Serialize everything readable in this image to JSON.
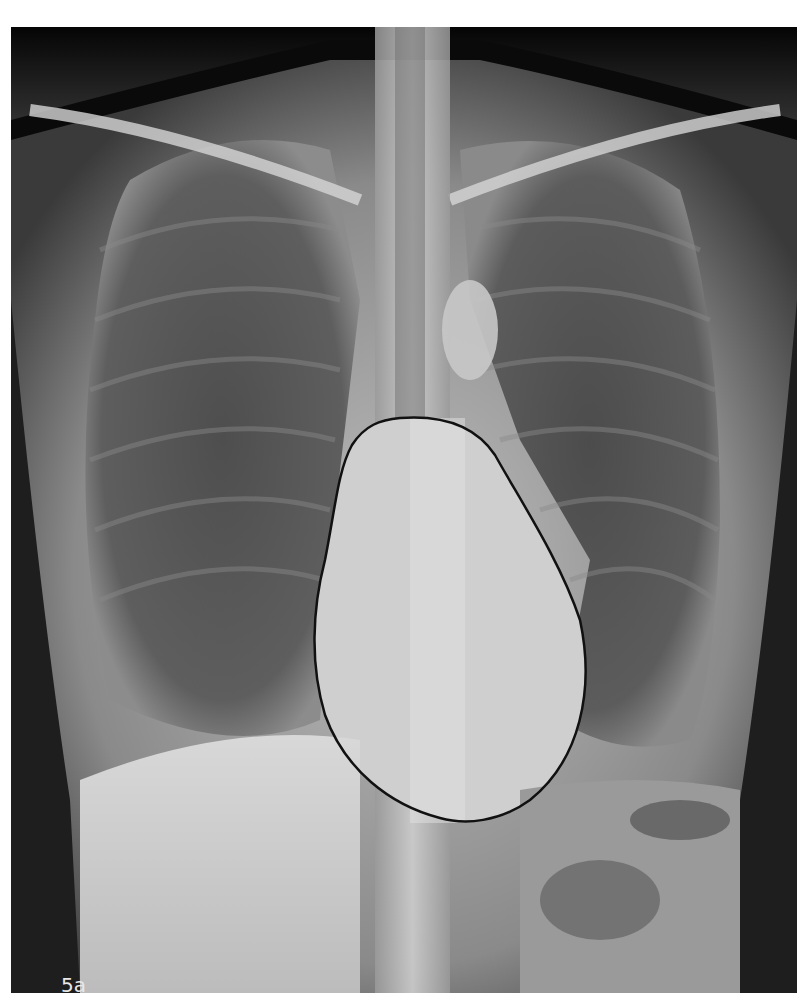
{
  "figure": {
    "label": "5a",
    "type": "Chest X-ray, PA view",
    "annotation": "Cardiac silhouette outlined in black",
    "colors": {
      "background": "#ffffff",
      "film_dark": "#0a0a0a",
      "outline": "#111111"
    }
  }
}
